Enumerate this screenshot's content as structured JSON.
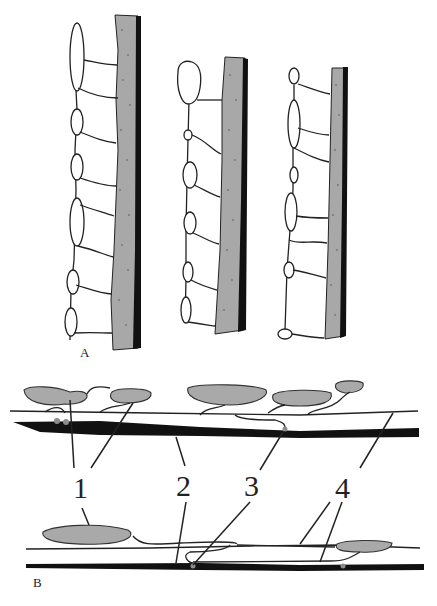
{
  "figure": {
    "panels": [
      {
        "id": "A",
        "label": "A",
        "description": "Three varicose fibers with vesicle-filled swellings attached to a stippled wall"
      },
      {
        "id": "B",
        "label": "B",
        "description": "Schematic of cell bodies, fibers and contacts along an axon"
      }
    ],
    "callouts": [
      {
        "number": "1",
        "target": "gray cell bodies"
      },
      {
        "number": "2",
        "target": "thick black axon"
      },
      {
        "number": "3",
        "target": "contact point"
      },
      {
        "number": "4",
        "target": "thin fibers"
      }
    ],
    "colors": {
      "wall_fill": "#a8a8a8",
      "wall_edge": "#111111",
      "cell_body": "#a9a9a9",
      "axon": "#111111",
      "contact": "#8c8c8c",
      "background": "#ffffff"
    }
  }
}
